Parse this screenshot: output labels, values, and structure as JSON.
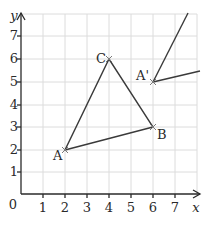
{
  "diagram": {
    "axes": {
      "x_label": "x",
      "y_label": "y",
      "origin_label": "0",
      "x_ticks": [
        "1",
        "2",
        "3",
        "4",
        "5",
        "6",
        "7"
      ],
      "y_ticks": [
        "1",
        "2",
        "3",
        "4",
        "5",
        "6",
        "7"
      ]
    },
    "triangle": {
      "vertices": [
        {
          "label": "A",
          "x": 2,
          "y": 2
        },
        {
          "label": "B",
          "x": 6,
          "y": 3
        },
        {
          "label": "C",
          "x": 4,
          "y": 6
        }
      ]
    },
    "image_point": {
      "label": "A'",
      "x": 6,
      "y": 5
    },
    "colors": {
      "line": "#3a3a3a",
      "grid": "#dcdcdc",
      "axis": "#2a2a2a",
      "text": "#2a2a2a"
    }
  }
}
